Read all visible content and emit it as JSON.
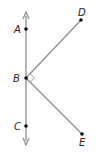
{
  "diagram": {
    "type": "geometry",
    "colors": {
      "line": "#888888",
      "point": "#111111",
      "label": "#222222",
      "background": "#ffffff"
    },
    "line": {
      "x": 26,
      "y_top": 14,
      "y_bottom": 143,
      "arrows": [
        "top",
        "bottom"
      ]
    },
    "points": [
      {
        "id": "A",
        "label": "A",
        "x": 26,
        "y": 29,
        "label_x": 14,
        "label_y": 33
      },
      {
        "id": "B",
        "label": "B",
        "x": 26,
        "y": 78,
        "label_x": 13,
        "label_y": 82
      },
      {
        "id": "C",
        "label": "C",
        "x": 26,
        "y": 126,
        "label_x": 14,
        "label_y": 130
      },
      {
        "id": "D",
        "label": "D",
        "x": 81,
        "y": 20,
        "label_x": 78,
        "label_y": 16
      },
      {
        "id": "E",
        "label": "E",
        "x": 82,
        "y": 134,
        "label_x": 79,
        "label_y": 146
      }
    ],
    "segments": [
      {
        "from": "B",
        "to": "D"
      },
      {
        "from": "B",
        "to": "E"
      }
    ],
    "right_angle_mark": {
      "vertex": "B",
      "between": [
        "D",
        "E"
      ]
    }
  }
}
